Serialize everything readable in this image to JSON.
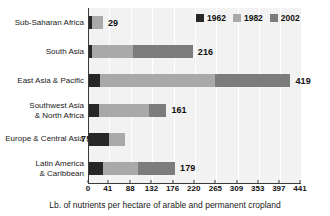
{
  "chart_data": {
    "type": "bar",
    "orientation": "horizontal",
    "stacked": true,
    "title": "",
    "xlabel": "Lb. of nutrients per hectare of arable and permanent cropland",
    "ylabel": "",
    "xlim": [
      0,
      441
    ],
    "grid": true,
    "legend_position": "top-right",
    "xticks": [
      0,
      41,
      88,
      132,
      176,
      220,
      265,
      309,
      353,
      397,
      441
    ],
    "xtick_labels": [
      "0",
      "41",
      "88",
      "132",
      "176",
      "220",
      "265",
      "309",
      "353",
      "397",
      "441"
    ],
    "categories": [
      "Sub-Saharan Africa",
      "South Asia",
      "East Asia & Pacific",
      "Southwest Asia\n& North Africa",
      "Europe & Central Asia",
      "Latin America\n& Caribbean"
    ],
    "series": [
      {
        "name": "1962",
        "color": "#272727",
        "values": [
          6,
          6,
          22,
          20,
          42,
          30
        ]
      },
      {
        "name": "1982",
        "color": "#a9a9a9",
        "values": [
          23,
          85,
          240,
          105,
          33,
          72
        ]
      },
      {
        "name": "2002",
        "color": "#7c7c7c",
        "values": [
          0,
          125,
          157,
          36,
          0,
          77
        ]
      }
    ],
    "totals": [
      29,
      216,
      419,
      161,
      75,
      179
    ],
    "total_labels": [
      "29",
      "216",
      "419",
      "161",
      "75",
      "179"
    ],
    "label_placement": [
      "outside",
      "outside",
      "outside",
      "outside",
      "inside",
      "outside"
    ]
  },
  "legend": {
    "items": [
      {
        "label": "1962",
        "color": "#272727"
      },
      {
        "label": "1982",
        "color": "#a9a9a9"
      },
      {
        "label": "2002",
        "color": "#7c7c7c"
      }
    ]
  },
  "axis": {
    "x_title": "Lb. of nutrients per hectare of arable and permanent cropland"
  }
}
